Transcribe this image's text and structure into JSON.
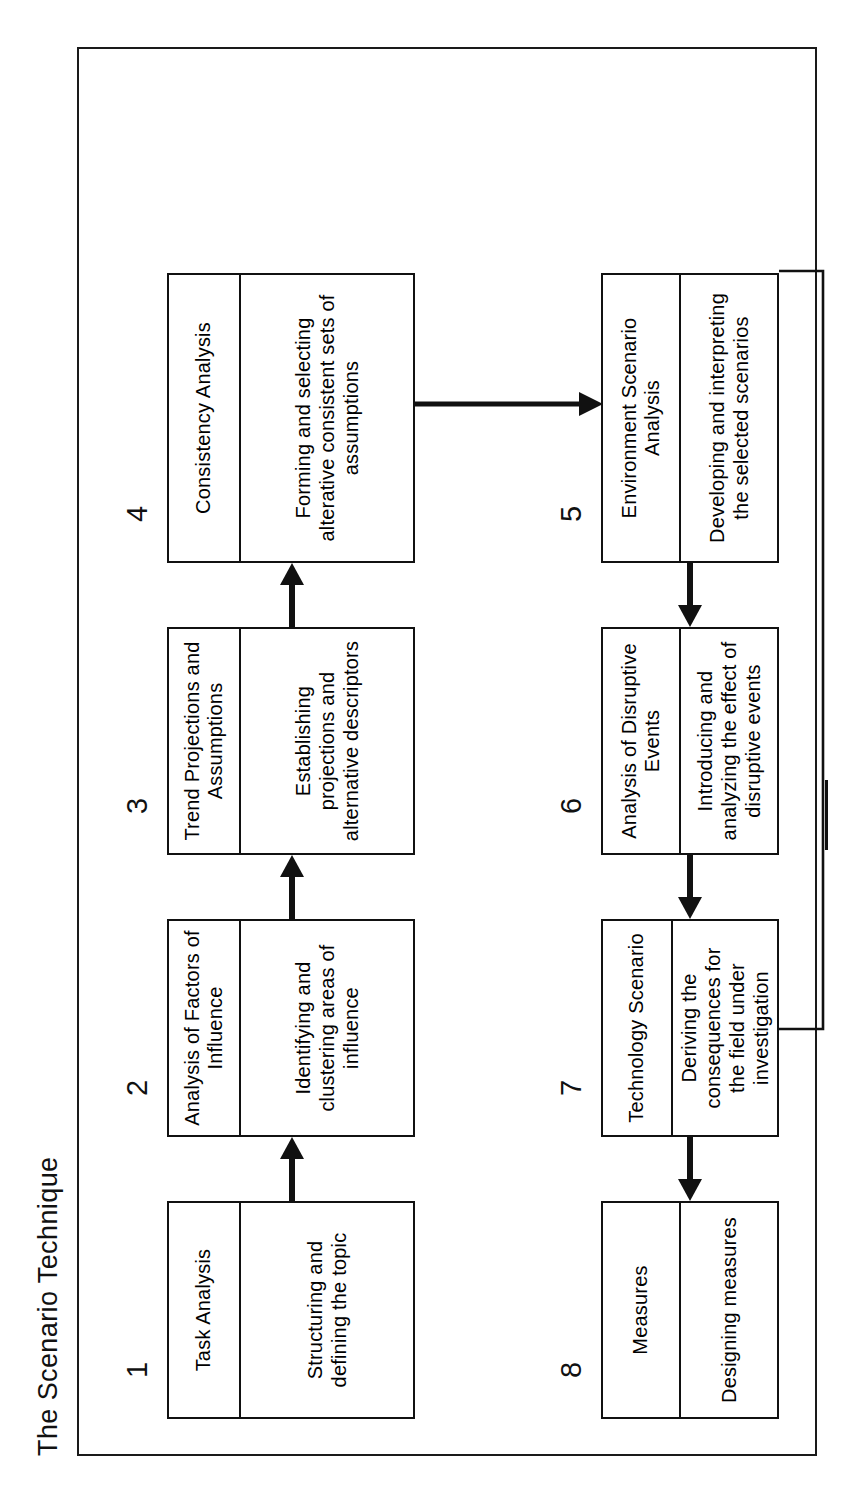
{
  "document": {
    "title": "The Scenario Technique"
  },
  "diagram": {
    "type": "flowchart",
    "orientation": "rotated-90-ccw",
    "frame_label": "",
    "rows": [
      {
        "name": "top-row",
        "steps": [
          1,
          2,
          3,
          4
        ]
      },
      {
        "name": "bottom-row",
        "steps": [
          5,
          6,
          7,
          8
        ]
      }
    ],
    "steps": [
      {
        "number": "1",
        "title": "Task Analysis",
        "description": "Structuring and defining the topic"
      },
      {
        "number": "2",
        "title": "Analysis of Factors of Influence",
        "description": "Identifying and clustering areas of influence"
      },
      {
        "number": "3",
        "title": "Trend Projections and Assumptions",
        "description": "Establishing projections and alternative descriptors"
      },
      {
        "number": "4",
        "title": "Consistency Analysis",
        "description": "Forming and selecting alterative consistent sets of assumptions"
      },
      {
        "number": "5",
        "title": "Environment Scenario Analysis",
        "description": "Developing and interpreting the selected scenarios"
      },
      {
        "number": "6",
        "title": "Analysis of Disruptive Events",
        "description": "Introducing and analyzing the effect of disruptive events"
      },
      {
        "number": "7",
        "title": "Technology Scenario",
        "description": "Deriving the consequences for the field under investigation"
      },
      {
        "number": "8",
        "title": "Measures",
        "description": "Designing measures"
      }
    ],
    "connections": [
      {
        "from": "1",
        "to": "2",
        "kind": "arrow"
      },
      {
        "from": "2",
        "to": "3",
        "kind": "arrow"
      },
      {
        "from": "3",
        "to": "4",
        "kind": "arrow"
      },
      {
        "from": "4",
        "to": "5",
        "kind": "arrow-wrap"
      },
      {
        "from": "5",
        "to": "6",
        "kind": "arrow"
      },
      {
        "from": "6",
        "to": "7",
        "kind": "arrow"
      },
      {
        "from": "7",
        "to": "8",
        "kind": "arrow"
      },
      {
        "from": "7",
        "to": "5",
        "kind": "feedback-loop"
      }
    ]
  },
  "colors": {
    "ink": "#111111",
    "paper": "#ffffff"
  }
}
